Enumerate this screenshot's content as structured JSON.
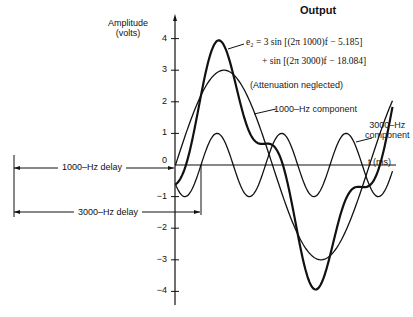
{
  "chart_data": {
    "type": "line",
    "title": "Output",
    "ylabel": "Amplitude (volts)",
    "xlabel": "t (ms)",
    "ylim": [
      -4,
      4
    ],
    "yticks": [
      4,
      3,
      2,
      1,
      0,
      -1,
      -2,
      -3,
      -4
    ],
    "grid": false,
    "series": [
      {
        "name": "Output e2 (sum)",
        "amplitude": 4,
        "description": "sum of 1000-Hz and 3000-Hz components",
        "peak": 3.8,
        "trough": -4.0
      },
      {
        "name": "1000-Hz component",
        "amplitude": 3,
        "frequency_hz": 1000,
        "phase_rad": -5.185
      },
      {
        "name": "3000-Hz component",
        "amplitude": 1,
        "frequency_hz": 3000,
        "phase_rad": -18.084
      }
    ],
    "annotations": [
      "e2 = 3 sin [(2π 1000)f − 5.185]",
      "+ sin [(2π 3000)f − 18.084]",
      "(Attenuation neglected)",
      "1000-Hz component",
      "3000-Hz component",
      "1000-Hz delay",
      "3000-Hz delay"
    ]
  },
  "labels": {
    "title": "Output",
    "ylabel_line1": "Amplitude",
    "ylabel_line2": "(volts)",
    "xlabel": "t (ms)",
    "eq_line1": "e₂ = 3 sin [(2π 1000)f − 5.185]",
    "eq_line2": "+ sin [(2π 3000)f − 18.084]",
    "attenuation": "(Attenuation neglected)",
    "comp1000": "1000–Hz component",
    "comp3000_line1": "3000–Hz",
    "comp3000_line2": "component",
    "delay1000": "1000–Hz delay",
    "delay3000": "3000–Hz delay"
  },
  "ticks": [
    "4",
    "3",
    "2",
    "1",
    "0",
    "−1",
    "−2",
    "−3",
    "−4"
  ],
  "geometry": {
    "axis_x": 175,
    "zero_y": 165,
    "px_per_volt": 31.6,
    "x_start": 175.5,
    "x_end": 393,
    "p1000_period_px": 194,
    "p1000_zero_x": 175.5,
    "p3000_period_px": 64.5,
    "p3000_zero_x": 201
  }
}
